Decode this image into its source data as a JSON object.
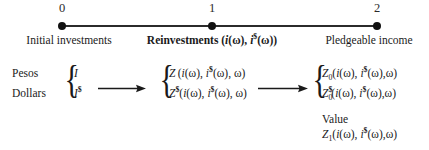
{
  "figure": {
    "type": "timeline-flow-diagram"
  },
  "timeline": {
    "nodes": [
      {
        "number": "0",
        "caption": "Initial investments",
        "bold": false,
        "x": 62
      },
      {
        "number": "1",
        "caption_parts": {
          "lead": "Reinvestments (",
          "var1": "i",
          "arg1": "(ω), ",
          "var2": "i",
          "sup2": "$",
          "arg2": "(ω))"
        },
        "bold": true,
        "x": 212
      },
      {
        "number": "2",
        "caption": "Pledgeable income",
        "bold": false,
        "x": 377
      }
    ],
    "axis": {
      "start_x": 62,
      "end_x": 377,
      "y": 26,
      "color": "#2b2b2b"
    }
  },
  "currency_rows": {
    "pesos_label": "Pesos",
    "dollars_label": "Dollars"
  },
  "stage1": {
    "brace": "{",
    "line1": {
      "symbol": "I"
    },
    "line2": {
      "symbol": "I",
      "sup": "$"
    }
  },
  "stage2": {
    "brace": "{",
    "line1": {
      "symbol": "Z",
      "sup": "",
      "sub": "",
      "args": "(i(ω), i$(ω), ω)"
    },
    "line2": {
      "symbol": "Z",
      "sup": "$",
      "sub": "",
      "args": "(i(ω), i$(ω), ω)"
    }
  },
  "stage3": {
    "brace": "{",
    "line1": {
      "symbol": "Z",
      "sup": "",
      "sub": "0",
      "args": "(i(ω), i$(ω), ω)"
    },
    "line2": {
      "symbol": "Z",
      "sup": "$",
      "sub": "0",
      "args": "(i(ω), i$(ω), ω)"
    }
  },
  "value": {
    "label": "Value",
    "expression": {
      "symbol": "Z",
      "sub": "1",
      "args": "(i(ω), i$(ω), ω)"
    }
  },
  "tokens": {
    "omega": "ω",
    "dollar": "$",
    "i": "i",
    "Z": "Z",
    "I": "I",
    "paren_open": "(",
    "paren_close": ")",
    "comma": ",",
    "zero": "0",
    "one": "1"
  },
  "colors": {
    "ink": "#1a1a1a",
    "axis": "#2b2b2b",
    "background": "#ffffff"
  }
}
